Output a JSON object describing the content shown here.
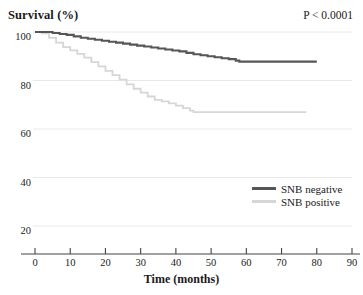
{
  "chart_data": {
    "type": "line",
    "title": "Survival (%)",
    "xlabel": "Time (months)",
    "ylabel": "Survival (%)",
    "xlim": [
      0,
      90
    ],
    "ylim": [
      0,
      105
    ],
    "grid": true,
    "legend_position": "right-middle",
    "annotations": [
      {
        "name": "p-value",
        "text": "P < 0.0001"
      }
    ],
    "xticks": [
      0,
      10,
      20,
      30,
      40,
      50,
      60,
      70,
      80,
      90
    ],
    "xtick_labels": [
      "0",
      "10",
      "20",
      "30",
      "40",
      "50",
      "60",
      "70",
      "80",
      "90"
    ],
    "yticks": [
      20,
      40,
      60,
      80,
      100
    ],
    "ytick_labels": [
      "20",
      "40",
      "60",
      "80",
      "100"
    ],
    "gridlines": [
      20,
      40,
      60,
      80,
      100
    ],
    "series": [
      {
        "name": "SNB negative",
        "color": "#565656",
        "step": "post",
        "x": [
          0,
          2,
          5,
          7,
          9,
          11,
          13,
          15,
          17,
          19,
          21,
          23,
          25,
          27,
          29,
          31,
          33,
          35,
          37,
          39,
          41,
          43,
          45,
          47,
          49,
          51,
          53,
          55,
          57,
          58,
          80
        ],
        "y": [
          100,
          100,
          99.6,
          99.2,
          98.8,
          98.2,
          97.6,
          97.2,
          96.8,
          96.4,
          96.0,
          95.6,
          95.2,
          94.8,
          94.4,
          94.0,
          93.6,
          93.2,
          92.8,
          92.4,
          92.0,
          91.4,
          90.8,
          90.4,
          90.0,
          89.6,
          89.2,
          88.8,
          88.2,
          87.8,
          87.8
        ]
      },
      {
        "name": "SNB positive",
        "color": "#d6d6d6",
        "step": "post",
        "x": [
          0,
          2,
          4,
          6,
          8,
          10,
          12,
          14,
          16,
          18,
          20,
          22,
          24,
          26,
          28,
          30,
          32,
          34,
          36,
          38,
          40,
          42,
          44,
          45,
          77
        ],
        "y": [
          100,
          99.4,
          97.6,
          95.6,
          93.8,
          92.4,
          91.0,
          89.4,
          87.6,
          85.8,
          84.0,
          82.2,
          80.4,
          78.4,
          76.6,
          75.0,
          73.4,
          72.0,
          71.4,
          70.6,
          69.6,
          68.6,
          67.6,
          67.0,
          67.0
        ]
      }
    ],
    "legend": [
      {
        "label": "SNB negative",
        "color": "#565656"
      },
      {
        "label": "SNB positive",
        "color": "#d6d6d6"
      }
    ],
    "axis_color": "#444444",
    "grid_color": "#e8e8e8"
  }
}
